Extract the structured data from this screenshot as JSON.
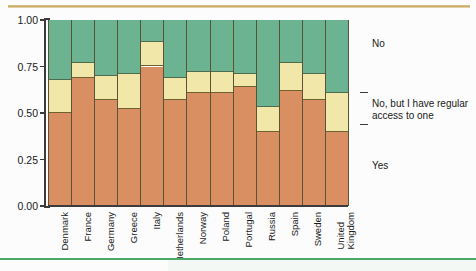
{
  "chart_data": {
    "type": "bar",
    "subtype": "stacked-bar-100-percent",
    "title": "",
    "xlabel": "",
    "ylabel": "",
    "ylim": [
      0,
      1
    ],
    "ytick_labels": [
      "0.00",
      "0.25",
      "0.50",
      "0.75",
      "1.00"
    ],
    "ytick_values": [
      0,
      0.25,
      0.5,
      0.75,
      1.0
    ],
    "grid": false,
    "legend_position": "right",
    "categories": [
      "Denmark",
      "France",
      "Germany",
      "Greece",
      "Italy",
      "Netherlands",
      "Norway",
      "Poland",
      "Portugal",
      "Russia",
      "Spain",
      "Sweden",
      "United\nKingdom"
    ],
    "series": [
      {
        "name": "Yes",
        "color": "#da8f63",
        "values": [
          0.5,
          0.69,
          0.57,
          0.52,
          0.75,
          0.57,
          0.61,
          0.61,
          0.64,
          0.4,
          0.62,
          0.57,
          0.4
        ]
      },
      {
        "name": "No, but I have regular access to one",
        "color": "#f0e7a8",
        "values": [
          0.18,
          0.08,
          0.13,
          0.19,
          0.13,
          0.12,
          0.11,
          0.11,
          0.07,
          0.13,
          0.15,
          0.14,
          0.21
        ]
      },
      {
        "name": "No",
        "color": "#6cb391",
        "values": [
          0.32,
          0.23,
          0.3,
          0.29,
          0.12,
          0.31,
          0.28,
          0.28,
          0.29,
          0.47,
          0.23,
          0.29,
          0.39
        ]
      }
    ],
    "stack_tops": {
      "yes_top": [
        0.5,
        0.69,
        0.57,
        0.52,
        0.75,
        0.57,
        0.61,
        0.61,
        0.64,
        0.4,
        0.62,
        0.57,
        0.4
      ],
      "mid_top": [
        0.68,
        0.77,
        0.7,
        0.71,
        0.88,
        0.69,
        0.72,
        0.72,
        0.71,
        0.53,
        0.77,
        0.71,
        0.61
      ]
    },
    "legend_entries": [
      {
        "label": "No",
        "color": "#6cb391"
      },
      {
        "label": "No, but I have regular\naccess to one",
        "color": "#f0e7a8"
      },
      {
        "label": "Yes",
        "color": "#da8f63"
      }
    ],
    "colors": {
      "no": "#6cb391",
      "no_but_access": "#f0e7a8",
      "yes": "#da8f63",
      "axis": "#3c3c3c",
      "top_rule": "#c9ad66",
      "bottom_rule": "#4aa868",
      "background": "#fbfcfb"
    }
  }
}
